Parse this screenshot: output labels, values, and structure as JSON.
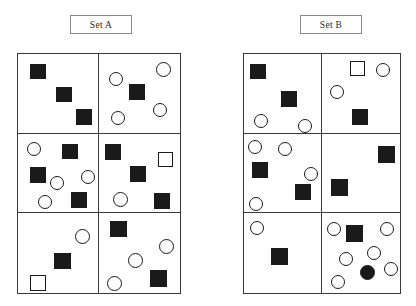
{
  "figure": {
    "title": "",
    "sets": [
      {
        "id": "set-a",
        "label": "Set A",
        "grid": {
          "columns": 2,
          "rows": 3
        },
        "cells": [
          {
            "id": "a1",
            "shapes": [
              {
                "type": "square-filled",
                "x": 12,
                "y": 10,
                "w": 16,
                "h": 15
              },
              {
                "type": "square-filled",
                "x": 38,
                "y": 33,
                "w": 16,
                "h": 15
              },
              {
                "type": "square-filled",
                "x": 58,
                "y": 55,
                "w": 16,
                "h": 16
              }
            ]
          },
          {
            "id": "a2",
            "shapes": [
              {
                "type": "circle-open",
                "x": 10,
                "y": 18,
                "w": 14,
                "h": 14
              },
              {
                "type": "circle-open",
                "x": 57,
                "y": 8,
                "w": 15,
                "h": 15
              },
              {
                "type": "square-filled",
                "x": 30,
                "y": 30,
                "w": 16,
                "h": 16
              },
              {
                "type": "circle-open",
                "x": 54,
                "y": 49,
                "w": 14,
                "h": 14
              },
              {
                "type": "circle-open",
                "x": 12,
                "y": 57,
                "w": 14,
                "h": 14
              }
            ]
          },
          {
            "id": "a3",
            "shapes": [
              {
                "type": "circle-open",
                "x": 9,
                "y": 8,
                "w": 14,
                "h": 14
              },
              {
                "type": "square-filled",
                "x": 44,
                "y": 10,
                "w": 16,
                "h": 15
              },
              {
                "type": "square-filled",
                "x": 12,
                "y": 33,
                "w": 16,
                "h": 16
              },
              {
                "type": "circle-open",
                "x": 32,
                "y": 42,
                "w": 14,
                "h": 14
              },
              {
                "type": "circle-open",
                "x": 63,
                "y": 36,
                "w": 14,
                "h": 14
              },
              {
                "type": "circle-open",
                "x": 20,
                "y": 61,
                "w": 14,
                "h": 14
              },
              {
                "type": "square-filled",
                "x": 53,
                "y": 58,
                "w": 16,
                "h": 16
              }
            ]
          },
          {
            "id": "a4",
            "shapes": [
              {
                "type": "square-filled",
                "x": 6,
                "y": 10,
                "w": 16,
                "h": 16
              },
              {
                "type": "square-open",
                "x": 59,
                "y": 18,
                "w": 15,
                "h": 15
              },
              {
                "type": "square-filled",
                "x": 31,
                "y": 32,
                "w": 16,
                "h": 16
              },
              {
                "type": "circle-open",
                "x": 14,
                "y": 58,
                "w": 15,
                "h": 15
              },
              {
                "type": "square-filled",
                "x": 55,
                "y": 59,
                "w": 16,
                "h": 16
              }
            ]
          },
          {
            "id": "a5",
            "shapes": [
              {
                "type": "circle-open",
                "x": 57,
                "y": 16,
                "w": 15,
                "h": 15
              },
              {
                "type": "square-filled",
                "x": 36,
                "y": 40,
                "w": 17,
                "h": 16
              },
              {
                "type": "square-open",
                "x": 12,
                "y": 62,
                "w": 16,
                "h": 16
              }
            ]
          },
          {
            "id": "a6",
            "shapes": [
              {
                "type": "square-filled",
                "x": 11,
                "y": 8,
                "w": 17,
                "h": 16
              },
              {
                "type": "circle-open",
                "x": 60,
                "y": 26,
                "w": 15,
                "h": 15
              },
              {
                "type": "circle-open",
                "x": 29,
                "y": 40,
                "w": 15,
                "h": 15
              },
              {
                "type": "square-filled",
                "x": 51,
                "y": 57,
                "w": 17,
                "h": 17
              },
              {
                "type": "circle-open",
                "x": 8,
                "y": 63,
                "w": 15,
                "h": 15
              }
            ]
          }
        ]
      },
      {
        "id": "set-b",
        "label": "Set B",
        "grid": {
          "columns": 2,
          "rows": 3
        },
        "cells": [
          {
            "id": "b1",
            "shapes": [
              {
                "type": "square-filled",
                "x": 6,
                "y": 10,
                "w": 16,
                "h": 15
              },
              {
                "type": "square-filled",
                "x": 37,
                "y": 37,
                "w": 16,
                "h": 16
              },
              {
                "type": "circle-open",
                "x": 10,
                "y": 60,
                "w": 14,
                "h": 14
              },
              {
                "type": "circle-open",
                "x": 54,
                "y": 65,
                "w": 14,
                "h": 14
              }
            ]
          },
          {
            "id": "b2",
            "shapes": [
              {
                "type": "square-open",
                "x": 28,
                "y": 7,
                "w": 15,
                "h": 15
              },
              {
                "type": "circle-open",
                "x": 54,
                "y": 9,
                "w": 14,
                "h": 14
              },
              {
                "type": "circle-open",
                "x": 8,
                "y": 31,
                "w": 14,
                "h": 14
              },
              {
                "type": "square-filled",
                "x": 30,
                "y": 55,
                "w": 16,
                "h": 16
              }
            ]
          },
          {
            "id": "b3",
            "shapes": [
              {
                "type": "circle-open",
                "x": 4,
                "y": 6,
                "w": 14,
                "h": 14
              },
              {
                "type": "circle-open",
                "x": 34,
                "y": 8,
                "w": 14,
                "h": 14
              },
              {
                "type": "square-filled",
                "x": 8,
                "y": 28,
                "w": 16,
                "h": 16
              },
              {
                "type": "circle-open",
                "x": 60,
                "y": 33,
                "w": 14,
                "h": 14
              },
              {
                "type": "square-filled",
                "x": 51,
                "y": 50,
                "w": 16,
                "h": 16
              },
              {
                "type": "circle-open",
                "x": 5,
                "y": 63,
                "w": 14,
                "h": 14
              }
            ]
          },
          {
            "id": "b4",
            "shapes": [
              {
                "type": "square-filled",
                "x": 56,
                "y": 12,
                "w": 17,
                "h": 17
              },
              {
                "type": "square-filled",
                "x": 9,
                "y": 45,
                "w": 17,
                "h": 17
              }
            ]
          },
          {
            "id": "b5",
            "shapes": [
              {
                "type": "circle-open",
                "x": 6,
                "y": 8,
                "w": 14,
                "h": 14
              },
              {
                "type": "square-filled",
                "x": 27,
                "y": 35,
                "w": 17,
                "h": 17
              }
            ]
          },
          {
            "id": "b6",
            "shapes": [
              {
                "type": "circle-open",
                "x": 5,
                "y": 9,
                "w": 14,
                "h": 14
              },
              {
                "type": "square-filled",
                "x": 24,
                "y": 12,
                "w": 17,
                "h": 17
              },
              {
                "type": "circle-open",
                "x": 58,
                "y": 9,
                "w": 14,
                "h": 14
              },
              {
                "type": "circle-open",
                "x": 45,
                "y": 33,
                "w": 14,
                "h": 14
              },
              {
                "type": "circle-open",
                "x": 17,
                "y": 39,
                "w": 14,
                "h": 14
              },
              {
                "type": "circle-filled",
                "x": 38,
                "y": 52,
                "w": 15,
                "h": 15
              },
              {
                "type": "circle-open",
                "x": 62,
                "y": 49,
                "w": 14,
                "h": 14
              },
              {
                "type": "circle-open",
                "x": 9,
                "y": 62,
                "w": 14,
                "h": 14
              }
            ]
          }
        ]
      }
    ],
    "colors": {
      "shape_fill": "#1a1a1a",
      "shape_stroke": "#1a1a1a",
      "grid_stroke": "#3a3a3a",
      "label_stroke": "#8a8a8a",
      "background": "#ffffff"
    }
  }
}
